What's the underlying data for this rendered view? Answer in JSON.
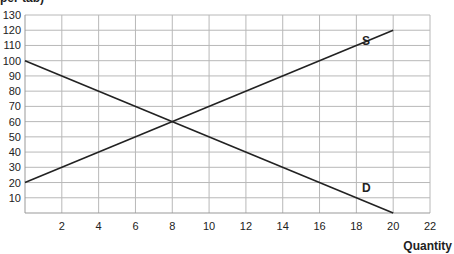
{
  "chart_data": {
    "type": "line",
    "title": "",
    "ylabel_partial": "per tab)",
    "xlabel": "Quantity",
    "xlim": [
      0,
      22
    ],
    "ylim": [
      0,
      130
    ],
    "x_ticks": [
      2,
      4,
      6,
      8,
      10,
      12,
      14,
      16,
      18,
      20,
      22
    ],
    "y_ticks": [
      10,
      20,
      30,
      40,
      50,
      60,
      70,
      80,
      90,
      100,
      110,
      120,
      130
    ],
    "grid": true,
    "series": [
      {
        "name": "S",
        "label": "S",
        "points": [
          [
            0,
            20
          ],
          [
            20,
            120
          ]
        ],
        "label_pos": [
          18.3,
          110
        ]
      },
      {
        "name": "D",
        "label": "D",
        "points": [
          [
            0,
            100
          ],
          [
            20,
            0
          ]
        ],
        "label_pos": [
          18.3,
          14
        ]
      }
    ],
    "equilibrium": {
      "quantity": 8,
      "price": 60
    }
  },
  "colors": {
    "line": "#222222",
    "grid": "#b8b8b8",
    "axis": "#999999"
  }
}
